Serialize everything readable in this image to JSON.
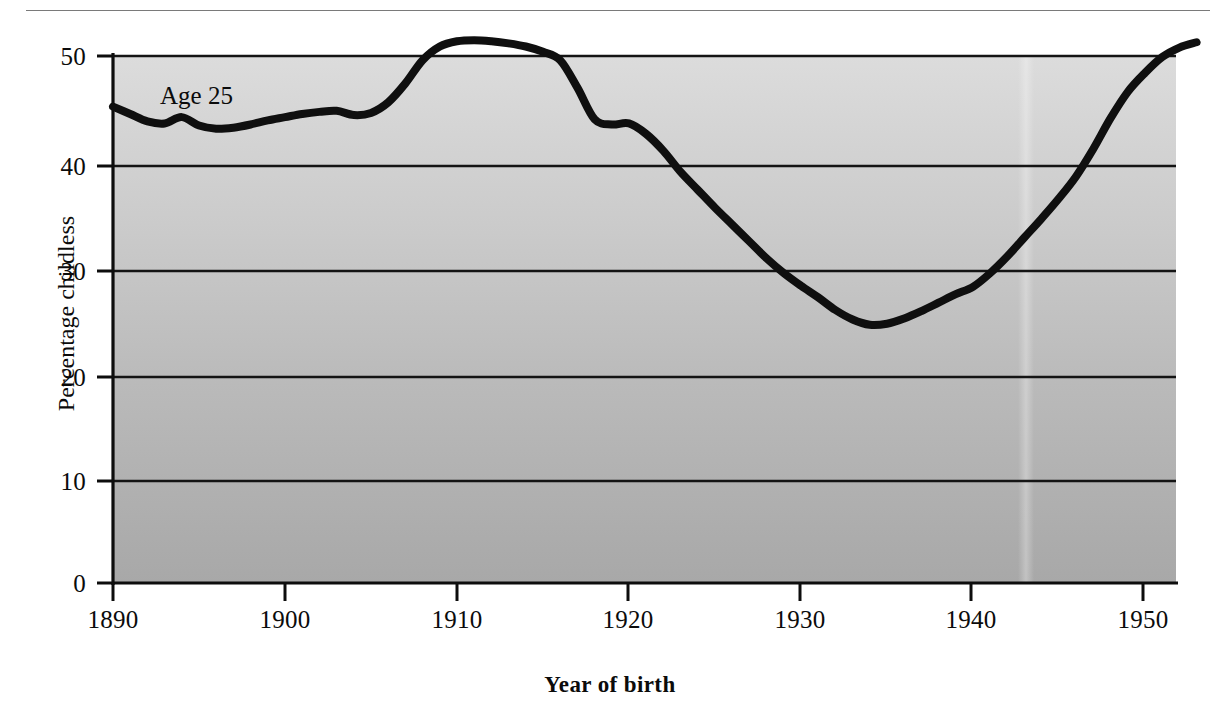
{
  "figure": {
    "background_color": "#ffffff",
    "plot_fill_top_color": "#d9d9d9",
    "plot_fill_bottom_color": "#ababab",
    "line_color": "#101010",
    "axis_color": "#101010",
    "top_rule_color": "#7a7a7a"
  },
  "chart_data": {
    "type": "line",
    "title": "",
    "subtitle": "",
    "xlabel": "Year of birth",
    "ylabel": "Percentage childless",
    "xlim": [
      1890,
      1953
    ],
    "ylim": [
      0,
      53
    ],
    "grid": "horizontal",
    "legend_position": "inline-annotation",
    "annotations": [
      {
        "text": "Age 25",
        "x": 1893,
        "y": 47.5
      }
    ],
    "xticks": [
      1890,
      1900,
      1910,
      1920,
      1930,
      1940,
      1950
    ],
    "xtick_labels": [
      "1890",
      "1900",
      "1910",
      "1920",
      "1930",
      "1940",
      "1950"
    ],
    "yticks": [
      0,
      10,
      20,
      30,
      40,
      50
    ],
    "ytick_labels": [
      "0",
      "10",
      "20",
      "30",
      "40",
      "50"
    ],
    "series": [
      {
        "name": "Age 25",
        "x": [
          1890,
          1891,
          1892,
          1893,
          1894,
          1895,
          1896,
          1897,
          1898,
          1899,
          1900,
          1901,
          1902,
          1903,
          1904,
          1905,
          1906,
          1907,
          1908,
          1909,
          1910,
          1911,
          1912,
          1913,
          1914,
          1915,
          1916,
          1917,
          1918,
          1919,
          1920,
          1921,
          1922,
          1923,
          1924,
          1925,
          1926,
          1927,
          1928,
          1929,
          1930,
          1931,
          1932,
          1933,
          1934,
          1935,
          1936,
          1937,
          1938,
          1939,
          1940,
          1941,
          1942,
          1943,
          1944,
          1945,
          1946,
          1947,
          1948,
          1949,
          1950,
          1951,
          1952,
          1953
        ],
        "values": [
          45.2,
          44.5,
          43.8,
          43.6,
          44.2,
          43.4,
          43.1,
          43.2,
          43.5,
          43.9,
          44.2,
          44.5,
          44.7,
          44.8,
          44.4,
          44.6,
          45.6,
          47.4,
          49.6,
          50.9,
          51.4,
          51.5,
          51.4,
          51.2,
          50.9,
          50.4,
          49.6,
          47.0,
          44.0,
          43.5,
          43.6,
          42.6,
          41.0,
          39.0,
          37.3,
          35.6,
          34.0,
          32.4,
          30.8,
          29.4,
          28.2,
          27.1,
          25.9,
          25.0,
          24.5,
          24.6,
          25.1,
          25.8,
          26.6,
          27.4,
          28.1,
          29.4,
          31.0,
          32.8,
          34.6,
          36.5,
          38.6,
          41.2,
          44.1,
          46.6,
          48.4,
          49.9,
          50.8,
          51.3
        ]
      }
    ]
  }
}
